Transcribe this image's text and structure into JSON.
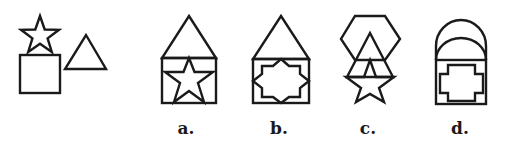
{
  "colors": {
    "stroke": "#1a1a1a",
    "background": "#ffffff"
  },
  "given": {
    "shapes": [
      "five-point-star",
      "square",
      "triangle"
    ]
  },
  "options": [
    {
      "label": "a.",
      "top": "triangle",
      "bottom": "square",
      "inner": "five-point-star"
    },
    {
      "label": "b.",
      "top": "triangle",
      "bottom": "square",
      "inner": "eight-point-star"
    },
    {
      "label": "c.",
      "top": "hexagon",
      "middle": "triangle",
      "bottom": "five-point-star"
    },
    {
      "label": "d.",
      "top": "double-arch",
      "bottom": "square",
      "inner": "cross"
    }
  ]
}
